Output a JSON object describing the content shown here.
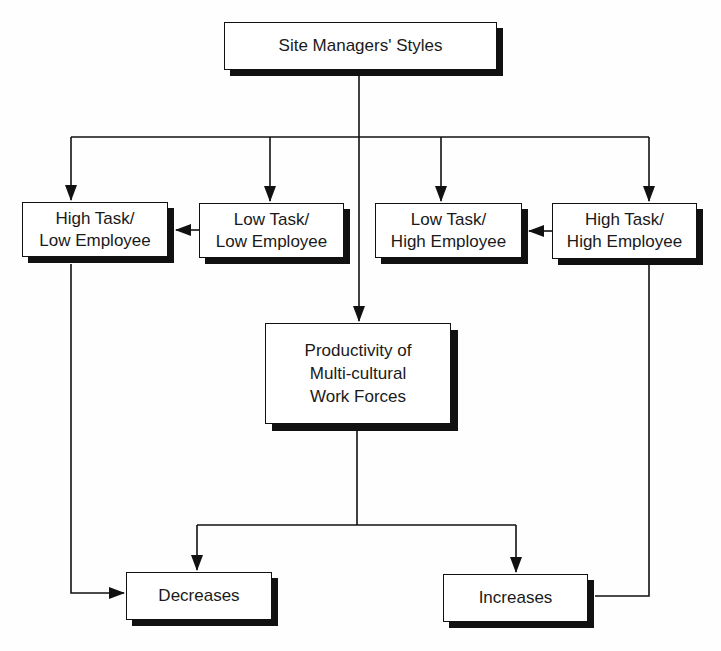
{
  "diagram": {
    "nodes": {
      "site_managers_styles": {
        "label": "Site Managers' Styles"
      },
      "high_task_low_employee": {
        "label": "High Task/\nLow Employee"
      },
      "low_task_low_employee": {
        "label": "Low Task/\nLow Employee"
      },
      "low_task_high_employee": {
        "label": "Low Task/\nHigh Employee"
      },
      "high_task_high_employee": {
        "label": "High Task/\nHigh Employee"
      },
      "productivity": {
        "label": "Productivity of\nMulti-cultural\nWork Forces"
      },
      "decreases": {
        "label": "Decreases"
      },
      "increases": {
        "label": "Increases"
      }
    },
    "edges": [
      {
        "from": "Site Managers' Styles",
        "to": "High Task/Low Employee"
      },
      {
        "from": "Site Managers' Styles",
        "to": "Low Task/Low Employee"
      },
      {
        "from": "Site Managers' Styles",
        "to": "Low Task/High Employee"
      },
      {
        "from": "Site Managers' Styles",
        "to": "High Task/High Employee"
      },
      {
        "from": "Site Managers' Styles",
        "to": "Productivity of Multi-cultural Work Forces"
      },
      {
        "from": "Low Task/Low Employee",
        "to": "High Task/Low Employee"
      },
      {
        "from": "High Task/High Employee",
        "to": "Low Task/High Employee"
      },
      {
        "from": "Productivity of Multi-cultural Work Forces",
        "to": "Decreases"
      },
      {
        "from": "Productivity of Multi-cultural Work Forces",
        "to": "Increases"
      },
      {
        "from": "High Task/Low Employee",
        "to": "Decreases"
      },
      {
        "from": "High Task/High Employee",
        "to": "Increases"
      }
    ],
    "colors": {
      "line": "#111111",
      "box_fill": "#ffffff",
      "shadow": "#111111",
      "background": "#fefefe"
    }
  }
}
